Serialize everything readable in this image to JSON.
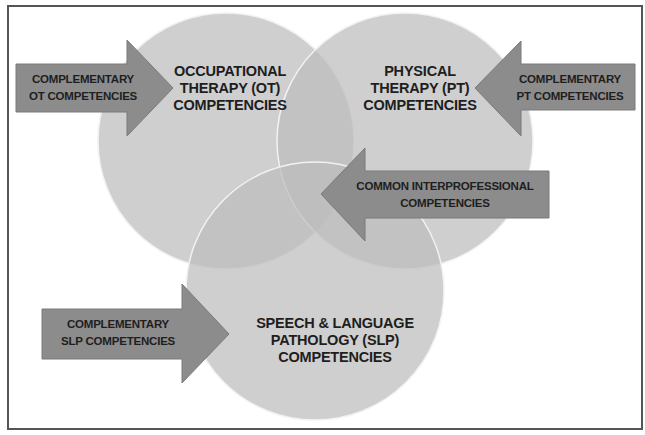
{
  "diagram": {
    "type": "venn-with-arrows",
    "colors": {
      "background": "#ffffff",
      "frame": "#555555",
      "circle_fill": "#bdbdbd",
      "circle_stroke": "#f2f2f2",
      "arrow_fill": "#8c8c8c",
      "arrow_stroke": "#7a7a7a",
      "text": "#1e1e1e"
    },
    "circles": [
      {
        "id": "ot",
        "lines": [
          "OCCUPATIONAL",
          "THERAPY (OT)",
          "COMPETENCIES"
        ]
      },
      {
        "id": "pt",
        "lines": [
          "PHYSICAL",
          "THERAPY (PT)",
          "COMPETENCIES"
        ]
      },
      {
        "id": "slp",
        "lines": [
          "SPEECH & LANGUAGE",
          "PATHOLOGY (SLP)",
          "COMPETENCIES"
        ]
      }
    ],
    "arrows": [
      {
        "id": "ot-arrow",
        "direction": "right",
        "lines": [
          "COMPLEMENTARY",
          "OT COMPETENCIES"
        ]
      },
      {
        "id": "pt-arrow",
        "direction": "left",
        "lines": [
          "COMPLEMENTARY",
          "PT COMPETENCIES"
        ]
      },
      {
        "id": "common-arrow",
        "direction": "left",
        "lines": [
          "COMMON INTERPROFESSIONAL",
          "COMPETENCIES"
        ]
      },
      {
        "id": "slp-arrow",
        "direction": "right",
        "lines": [
          "COMPLEMENTARY",
          "SLP COMPETENCIES"
        ]
      }
    ]
  }
}
